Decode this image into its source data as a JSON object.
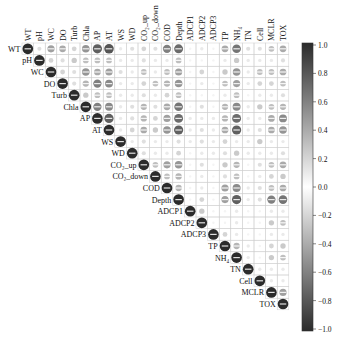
{
  "chart_data": {
    "type": "heatmap",
    "subtype": "corrplot-circle-upper",
    "title": "",
    "variables": [
      "WT",
      "pH",
      "WC",
      "DO",
      "Turb",
      "Chla",
      "AP",
      "AT",
      "WS",
      "WD",
      "CO₂_up",
      "CO₂_down",
      "COD",
      "Depth",
      "ADCP1",
      "ADCP2",
      "ADCP3",
      "TP",
      "NH₄",
      "TN",
      "Cell",
      "MCLR",
      "TOX"
    ],
    "colorbar": {
      "ticks": [
        1.0,
        0.8,
        0.6,
        0.4,
        0.2,
        0.0,
        -0.2,
        -0.4,
        -0.6,
        -0.8,
        -1.0
      ],
      "tick_labels": [
        "1.0",
        "0.8",
        "0.6",
        "0.4",
        "0.2",
        "0.0",
        "−0.2",
        "−0.4",
        "−0.6",
        "−0.8",
        "−1.0"
      ],
      "range": [
        -1,
        1
      ],
      "position": "right"
    },
    "matrix_upper": [
      [
        1.0,
        0.15,
        0.45,
        0.4,
        0.2,
        0.5,
        0.75,
        0.8,
        0.1,
        0.15,
        0.2,
        0.15,
        0.6,
        0.7,
        0.05,
        0.1,
        0.05,
        0.4,
        0.65,
        0.15,
        0.15,
        0.3,
        0.4
      ],
      [
        1.0,
        0.2,
        0.15,
        0.25,
        0.3,
        0.3,
        0.3,
        0.1,
        0.1,
        0.15,
        0.1,
        0.1,
        0.3,
        0.05,
        0.05,
        0.05,
        0.1,
        0.25,
        0.1,
        0.1,
        0.1,
        0.15
      ],
      [
        1.0,
        0.2,
        0.15,
        0.5,
        0.4,
        0.45,
        0.15,
        0.1,
        0.3,
        0.1,
        0.3,
        0.45,
        0.05,
        0.2,
        0.05,
        0.25,
        0.5,
        0.1,
        0.3,
        0.3,
        0.4
      ],
      [
        1.0,
        0.15,
        0.35,
        0.6,
        0.55,
        0.1,
        0.1,
        0.2,
        0.3,
        0.35,
        0.5,
        0.05,
        0.1,
        0.05,
        0.3,
        0.45,
        0.1,
        0.2,
        0.2,
        0.3
      ],
      [
        1.0,
        0.25,
        0.3,
        0.3,
        0.1,
        0.1,
        0.15,
        0.1,
        0.2,
        0.3,
        0.05,
        0.05,
        0.05,
        0.1,
        0.3,
        0.05,
        0.1,
        0.1,
        0.15
      ],
      [
        1.0,
        0.6,
        0.55,
        0.1,
        0.15,
        0.35,
        0.15,
        0.4,
        0.65,
        0.05,
        0.15,
        0.05,
        0.35,
        0.55,
        0.1,
        0.25,
        0.3,
        0.35
      ],
      [
        1.0,
        0.75,
        0.1,
        0.15,
        0.35,
        0.2,
        0.45,
        0.7,
        0.1,
        0.1,
        0.1,
        0.35,
        0.7,
        0.1,
        0.1,
        0.4,
        0.55
      ],
      [
        1.0,
        0.1,
        0.2,
        0.4,
        0.25,
        0.5,
        0.75,
        0.1,
        0.15,
        0.1,
        0.4,
        0.75,
        0.1,
        0.15,
        0.4,
        0.5
      ],
      [
        1.0,
        0.1,
        0.15,
        0.1,
        0.1,
        0.15,
        0.1,
        0.15,
        0.1,
        0.2,
        0.1,
        0.1,
        0.25,
        0.1,
        0.1
      ],
      [
        1.0,
        0.15,
        0.1,
        0.1,
        0.2,
        0.05,
        0.1,
        0.1,
        0.15,
        0.25,
        0.1,
        0.1,
        0.1,
        0.15
      ],
      [
        1.0,
        0.3,
        0.45,
        0.5,
        0.05,
        0.15,
        0.05,
        0.25,
        0.35,
        0.05,
        0.15,
        0.3,
        0.4
      ],
      [
        1.0,
        0.3,
        0.35,
        0.05,
        0.1,
        0.05,
        0.15,
        0.3,
        0.05,
        0.1,
        0.2,
        0.25
      ],
      [
        1.0,
        0.35,
        0.05,
        0.1,
        0.05,
        0.45,
        0.55,
        0.1,
        0.15,
        0.3,
        0.4
      ],
      [
        1.0,
        0.05,
        0.2,
        0.05,
        0.45,
        0.75,
        0.1,
        0.15,
        0.6,
        0.65
      ],
      [
        1.0,
        0.25,
        0.05,
        0.05,
        0.1,
        0.05,
        0.05,
        0.1,
        0.1
      ],
      [
        1.0,
        0.05,
        0.05,
        0.1,
        0.05,
        0.05,
        0.25,
        0.3
      ],
      [
        1.0,
        0.2,
        0.1,
        0.05,
        0.05,
        0.1,
        0.1
      ],
      [
        1.0,
        0.35,
        0.1,
        0.05,
        0.2,
        0.25
      ],
      [
        1.0,
        0.1,
        0.05,
        0.25,
        0.3
      ],
      [
        1.0,
        0.1,
        0.1,
        0.1
      ],
      [
        1.0,
        0.1,
        0.1
      ],
      [
        1.0,
        0.45
      ],
      [
        1.0
      ]
    ],
    "color_scheme": "grayscale (dark = |r| high)",
    "legend_position": "right"
  }
}
